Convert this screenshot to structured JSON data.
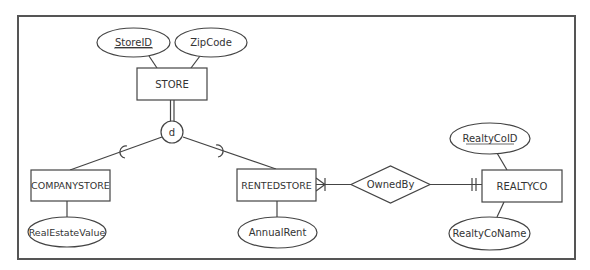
{
  "diagram": {
    "type": "ER diagram (specialization with disjoint constraint)",
    "colors": {
      "stroke": "#444444",
      "text": "#333333",
      "background": "#ffffff"
    },
    "entities": [
      {
        "id": "store",
        "label": "STORE"
      },
      {
        "id": "companystore",
        "label": "COMPANYSTORE"
      },
      {
        "id": "rentedstore",
        "label": "RENTEDSTORE"
      },
      {
        "id": "realtyco",
        "label": "REALTYCO"
      }
    ],
    "attributes": [
      {
        "id": "storeid",
        "label": "StoreID",
        "entity": "store",
        "key": true
      },
      {
        "id": "zipcode",
        "label": "ZipCode",
        "entity": "store",
        "key": false
      },
      {
        "id": "realestatevalue",
        "label": "RealEstateValue",
        "entity": "companystore",
        "key": false
      },
      {
        "id": "annualrent",
        "label": "AnnualRent",
        "entity": "rentedstore",
        "key": false
      },
      {
        "id": "realtycoid",
        "label": "RealtyCoID",
        "entity": "realtyco",
        "key": true
      },
      {
        "id": "realtyconame",
        "label": "RealtyCoName",
        "entity": "realtyco",
        "key": false
      }
    ],
    "relationships": [
      {
        "id": "ownedby",
        "label": "OwnedBy",
        "from": "rentedstore",
        "from_cardinality": "one-or-many",
        "to": "realtyco",
        "to_cardinality": "exactly-one"
      }
    ],
    "specialization": {
      "superclass": "store",
      "constraint_label": "d",
      "participation": "total",
      "subclasses": [
        "companystore",
        "rentedstore"
      ]
    }
  }
}
